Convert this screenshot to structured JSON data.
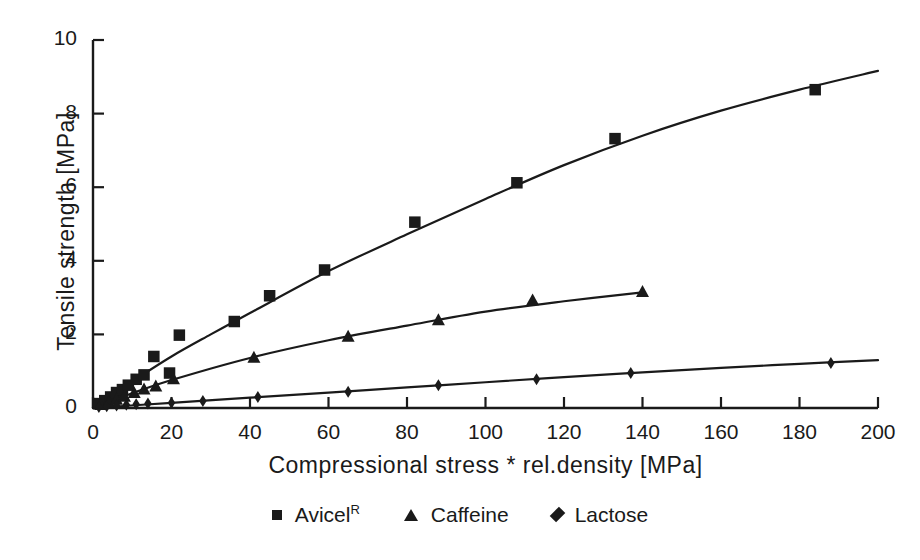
{
  "chart_data": {
    "type": "scatter",
    "title": "",
    "xlabel": "Compressional stress * rel.density [MPa]",
    "ylabel": "Tensile strength [MPa]",
    "xlim": [
      0,
      200
    ],
    "ylim": [
      0,
      10
    ],
    "xticks": [
      0,
      20,
      40,
      60,
      80,
      100,
      120,
      140,
      160,
      180,
      200
    ],
    "yticks": [
      0,
      2,
      4,
      6,
      8,
      10
    ],
    "grid": false,
    "legend_position": "below",
    "marker_color": "#1a1a1a",
    "line_color": "#1a1a1a",
    "background": "#ffffff",
    "series": [
      {
        "name": "Avicel",
        "superscript": "R",
        "marker": "square",
        "points": [
          {
            "x": 1.5,
            "y": 0.12
          },
          {
            "x": 3.0,
            "y": 0.2
          },
          {
            "x": 4.5,
            "y": 0.3
          },
          {
            "x": 6.0,
            "y": 0.42
          },
          {
            "x": 7.5,
            "y": 0.5
          },
          {
            "x": 9.0,
            "y": 0.62
          },
          {
            "x": 11.0,
            "y": 0.78
          },
          {
            "x": 13.0,
            "y": 0.9
          },
          {
            "x": 15.5,
            "y": 1.4
          },
          {
            "x": 19.5,
            "y": 0.95
          },
          {
            "x": 22.0,
            "y": 1.98
          },
          {
            "x": 36.0,
            "y": 2.35
          },
          {
            "x": 45.0,
            "y": 3.05
          },
          {
            "x": 59.0,
            "y": 3.75
          },
          {
            "x": 82.0,
            "y": 5.05
          },
          {
            "x": 108.0,
            "y": 6.12
          },
          {
            "x": 133.0,
            "y": 7.32
          },
          {
            "x": 184.0,
            "y": 8.65
          }
        ]
      },
      {
        "name": "Caffeine",
        "superscript": "",
        "marker": "triangle",
        "points": [
          {
            "x": 2.0,
            "y": 0.08
          },
          {
            "x": 4.0,
            "y": 0.15
          },
          {
            "x": 6.0,
            "y": 0.22
          },
          {
            "x": 8.0,
            "y": 0.3
          },
          {
            "x": 10.5,
            "y": 0.4
          },
          {
            "x": 13.0,
            "y": 0.5
          },
          {
            "x": 16.0,
            "y": 0.58
          },
          {
            "x": 20.5,
            "y": 0.78
          },
          {
            "x": 41.0,
            "y": 1.36
          },
          {
            "x": 65.0,
            "y": 1.93
          },
          {
            "x": 112.0,
            "y": 2.92
          },
          {
            "x": 88.0,
            "y": 2.38
          },
          {
            "x": 140.0,
            "y": 3.15
          }
        ]
      },
      {
        "name": "Lactose",
        "superscript": "",
        "marker": "diamond",
        "points": [
          {
            "x": 1.5,
            "y": 0.03
          },
          {
            "x": 3.5,
            "y": 0.05
          },
          {
            "x": 6.0,
            "y": 0.07
          },
          {
            "x": 8.5,
            "y": 0.09
          },
          {
            "x": 11.0,
            "y": 0.1
          },
          {
            "x": 14.0,
            "y": 0.12
          },
          {
            "x": 20.0,
            "y": 0.14
          },
          {
            "x": 28.0,
            "y": 0.19
          },
          {
            "x": 42.0,
            "y": 0.3
          },
          {
            "x": 65.0,
            "y": 0.44
          },
          {
            "x": 88.0,
            "y": 0.62
          },
          {
            "x": 113.0,
            "y": 0.78
          },
          {
            "x": 137.0,
            "y": 0.95
          },
          {
            "x": 188.0,
            "y": 1.22
          }
        ]
      }
    ],
    "fit_curves": [
      {
        "name": "Avicel",
        "description": "concave increasing fit through Avicel points",
        "path": [
          {
            "x": 0,
            "y": 0
          },
          {
            "x": 10,
            "y": 0.72
          },
          {
            "x": 20,
            "y": 1.4
          },
          {
            "x": 30,
            "y": 2.0
          },
          {
            "x": 40,
            "y": 2.58
          },
          {
            "x": 60,
            "y": 3.72
          },
          {
            "x": 80,
            "y": 4.72
          },
          {
            "x": 100,
            "y": 5.68
          },
          {
            "x": 120,
            "y": 6.6
          },
          {
            "x": 140,
            "y": 7.4
          },
          {
            "x": 160,
            "y": 8.08
          },
          {
            "x": 180,
            "y": 8.65
          },
          {
            "x": 200,
            "y": 9.16
          }
        ]
      },
      {
        "name": "Caffeine",
        "description": "concave increasing fit through Caffeine points",
        "path": [
          {
            "x": 0,
            "y": 0
          },
          {
            "x": 10,
            "y": 0.4
          },
          {
            "x": 20,
            "y": 0.76
          },
          {
            "x": 40,
            "y": 1.36
          },
          {
            "x": 60,
            "y": 1.84
          },
          {
            "x": 80,
            "y": 2.24
          },
          {
            "x": 100,
            "y": 2.62
          },
          {
            "x": 120,
            "y": 2.9
          },
          {
            "x": 140,
            "y": 3.14
          }
        ]
      },
      {
        "name": "Lactose",
        "description": "near-linear fit through Lactose points",
        "path": [
          {
            "x": 0,
            "y": 0
          },
          {
            "x": 20,
            "y": 0.14
          },
          {
            "x": 40,
            "y": 0.28
          },
          {
            "x": 60,
            "y": 0.42
          },
          {
            "x": 80,
            "y": 0.56
          },
          {
            "x": 100,
            "y": 0.7
          },
          {
            "x": 120,
            "y": 0.84
          },
          {
            "x": 140,
            "y": 0.97
          },
          {
            "x": 160,
            "y": 1.09
          },
          {
            "x": 180,
            "y": 1.2
          },
          {
            "x": 200,
            "y": 1.3
          }
        ]
      }
    ]
  },
  "legend": {
    "entries": [
      {
        "label": "Avicel",
        "superscript": "R",
        "marker": "square"
      },
      {
        "label": "Caffeine",
        "superscript": "",
        "marker": "triangle"
      },
      {
        "label": "Lactose",
        "superscript": "",
        "marker": "diamond"
      }
    ]
  }
}
